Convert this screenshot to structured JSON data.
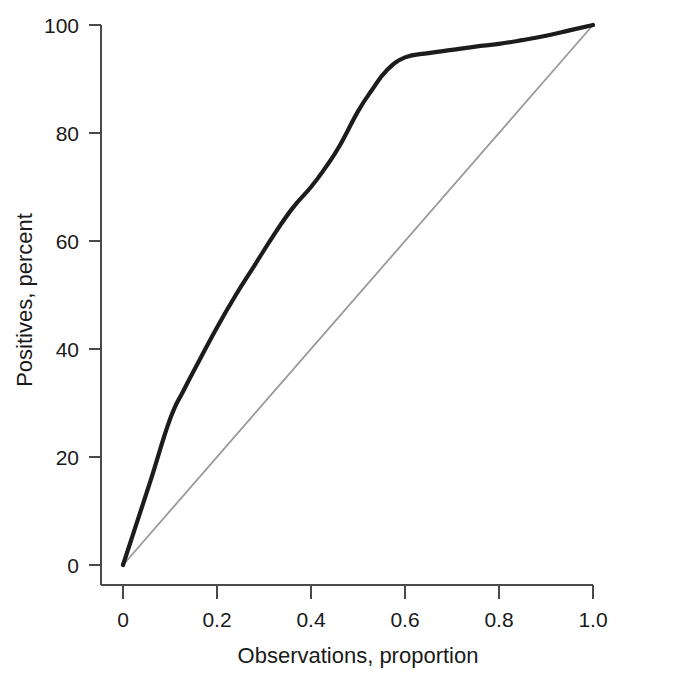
{
  "chart_data": {
    "type": "line",
    "title": "",
    "subtitle": "",
    "xlabel": "Observations, proportion",
    "ylabel": "Positives, percent",
    "xlim": [
      0,
      1.0
    ],
    "ylim": [
      0,
      100
    ],
    "xticks": [
      "0",
      "0.2",
      "0.4",
      "0.6",
      "0.8",
      "1.0"
    ],
    "xtick_values": [
      0,
      0.2,
      0.4,
      0.6,
      0.8,
      1.0
    ],
    "yticks": [
      "0",
      "20",
      "40",
      "60",
      "80",
      "100"
    ],
    "ytick_values": [
      0,
      20,
      40,
      60,
      80,
      100
    ],
    "grid": false,
    "legend": null,
    "legend_position": "none",
    "series": [
      {
        "name": "Gain curve",
        "color": "#1c1c1c",
        "style": "solid-thick",
        "x": [
          0,
          0.03,
          0.06,
          0.1,
          0.13,
          0.16,
          0.2,
          0.24,
          0.28,
          0.32,
          0.36,
          0.4,
          0.43,
          0.46,
          0.5,
          0.53,
          0.56,
          0.6,
          0.65,
          0.7,
          0.75,
          0.8,
          0.85,
          0.9,
          0.95,
          1.0
        ],
        "values": [
          0,
          8,
          16,
          27,
          32.5,
          37.5,
          44,
          50,
          55.5,
          61,
          66,
          70,
          73.5,
          77.5,
          84,
          88,
          91.5,
          94,
          94.8,
          95.4,
          96,
          96.5,
          97.2,
          98,
          99,
          100
        ]
      },
      {
        "name": "Baseline reference",
        "color": "#9a9a9a",
        "style": "solid-thin",
        "x": [
          0,
          1.0
        ],
        "values": [
          0,
          100
        ]
      }
    ]
  },
  "figure": {
    "background_color": "#ffffff",
    "axis_color": "#4a4a4a",
    "text_color": "#1a1a1a"
  }
}
